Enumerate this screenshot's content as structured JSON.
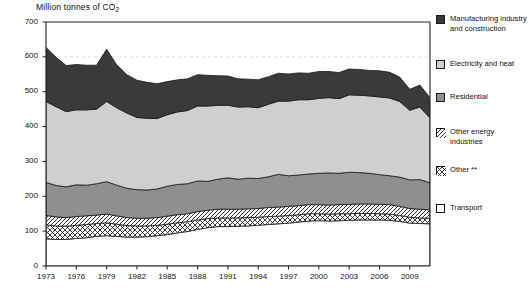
{
  "chart_title": "Million tonnes of CO2",
  "chart_title_main": "Million tonnes of CO",
  "chart_title_sub": "2",
  "legend": {
    "items": [
      {
        "label": "Manufacturing industry and construction",
        "swatch": "dark-solid-swatch",
        "color": "#3a3a3a",
        "pattern": "solid"
      },
      {
        "label": "Electricity and heat",
        "swatch": "light-gray-solid-swatch",
        "color": "#cfcfcf",
        "pattern": "solid"
      },
      {
        "label": "Residential",
        "swatch": "medium-gray-solid-swatch",
        "color": "#8f8f8f",
        "pattern": "solid"
      },
      {
        "label": "Other energy industries",
        "swatch": "diagonal-hatch-swatch",
        "color": "#ffffff",
        "pattern": "diagonal-hatch"
      },
      {
        "label": "Other **",
        "swatch": "cross-hatch-swatch",
        "color": "#ffffff",
        "pattern": "cross-hatch"
      },
      {
        "label": "Transport",
        "swatch": "white-solid-swatch",
        "color": "#ffffff",
        "pattern": "solid"
      }
    ]
  },
  "chart_data": {
    "type": "area",
    "stacked": true,
    "title": "Million tonnes of CO2",
    "xlabel": "",
    "ylabel": "Million tonnes of CO2",
    "ylim": [
      0,
      700
    ],
    "ytick_step": 100,
    "yticks": [
      0,
      100,
      200,
      300,
      400,
      500,
      600,
      700
    ],
    "xlim": [
      1973,
      2011
    ],
    "xticks": [
      1973,
      1976,
      1979,
      1982,
      1985,
      1988,
      1991,
      1994,
      1997,
      2000,
      2003,
      2006,
      2009
    ],
    "gridlines": "dashed-horizontal",
    "legend_position": "right",
    "x": [
      1973,
      1974,
      1975,
      1976,
      1977,
      1978,
      1979,
      1980,
      1981,
      1982,
      1983,
      1984,
      1985,
      1986,
      1987,
      1988,
      1989,
      1990,
      1991,
      1992,
      1993,
      1994,
      1995,
      1996,
      1997,
      1998,
      1999,
      2000,
      2001,
      2002,
      2003,
      2004,
      2005,
      2006,
      2007,
      2008,
      2009,
      2010,
      2011
    ],
    "series": [
      {
        "name": "Transport",
        "color": "#ffffff",
        "pattern": "solid",
        "values": [
          78,
          76,
          76,
          79,
          81,
          85,
          87,
          85,
          83,
          83,
          84,
          87,
          90,
          95,
          99,
          105,
          110,
          113,
          113,
          114,
          115,
          117,
          119,
          121,
          123,
          126,
          129,
          130,
          129,
          130,
          131,
          132,
          132,
          132,
          131,
          128,
          123,
          122,
          121
        ]
      },
      {
        "name": "Other **",
        "color": "#ffffff",
        "pattern": "cross-hatch",
        "values": [
          40,
          39,
          38,
          38,
          38,
          37,
          37,
          35,
          33,
          32,
          31,
          30,
          30,
          29,
          28,
          27,
          26,
          25,
          25,
          24,
          24,
          23,
          23,
          22,
          22,
          21,
          21,
          20,
          20,
          20,
          19,
          19,
          19,
          18,
          18,
          17,
          17,
          16,
          16
        ]
      },
      {
        "name": "Other energy industries",
        "color": "#ffffff",
        "pattern": "diagonal-hatch",
        "values": [
          27,
          26,
          25,
          25,
          25,
          24,
          25,
          24,
          23,
          22,
          22,
          22,
          23,
          23,
          23,
          24,
          24,
          25,
          25,
          25,
          25,
          25,
          26,
          26,
          26,
          26,
          26,
          26,
          26,
          26,
          27,
          27,
          27,
          27,
          27,
          26,
          25,
          25,
          24
        ]
      },
      {
        "name": "Residential",
        "color": "#8f8f8f",
        "pattern": "solid",
        "values": [
          95,
          90,
          88,
          91,
          88,
          90,
          93,
          88,
          84,
          82,
          81,
          82,
          86,
          87,
          86,
          88,
          83,
          86,
          90,
          86,
          88,
          86,
          88,
          94,
          88,
          88,
          88,
          90,
          92,
          90,
          92,
          90,
          88,
          85,
          83,
          84,
          82,
          85,
          78
        ]
      },
      {
        "name": "Electricity and heat",
        "color": "#cfcfcf",
        "pattern": "solid",
        "values": [
          232,
          226,
          216,
          215,
          216,
          214,
          230,
          222,
          216,
          207,
          206,
          202,
          205,
          208,
          210,
          215,
          216,
          212,
          208,
          207,
          205,
          203,
          208,
          210,
          214,
          216,
          213,
          215,
          216,
          214,
          222,
          222,
          222,
          223,
          223,
          217,
          200,
          208,
          186
        ]
      },
      {
        "name": "Manufacturing industry and construction",
        "color": "#3a3a3a",
        "pattern": "solid",
        "values": [
          155,
          142,
          132,
          130,
          128,
          126,
          150,
          123,
          110,
          107,
          103,
          100,
          95,
          92,
          91,
          90,
          88,
          85,
          84,
          81,
          79,
          80,
          79,
          80,
          78,
          77,
          76,
          77,
          75,
          75,
          74,
          74,
          73,
          75,
          74,
          70,
          60,
          63,
          58
        ]
      }
    ]
  }
}
